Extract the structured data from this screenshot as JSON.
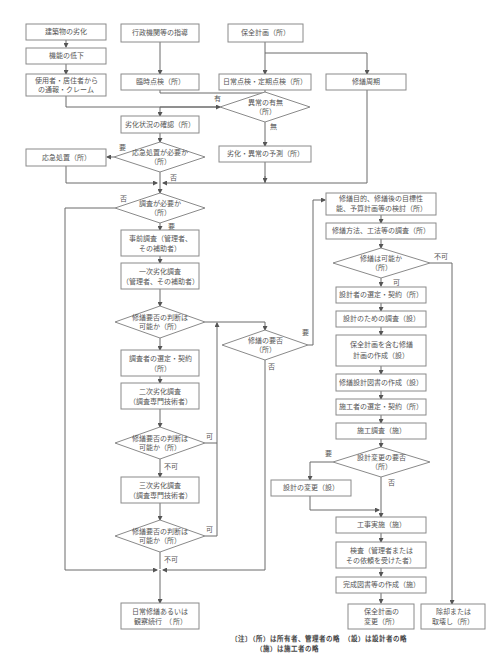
{
  "diagram": {
    "top": {
      "deterioration": "建築物の劣化",
      "function_decline": "機能の低下",
      "report_l1": "使用者・居住者から",
      "report_l2": "の通報・クレーム",
      "admin_guidance": "行政機関等の指導",
      "adhoc_inspection": "臨時点検（所）",
      "maintenance_plan": "保全計画（所）",
      "routine_inspection": "日常点検・定期点検（所）",
      "repair_cycle": "修繕周期"
    },
    "left": {
      "abnormality_q_l1": "異常の有無",
      "abnormality_q_l2": "（所）",
      "label_yes": "有",
      "label_no": "無",
      "confirm_condition": "劣化状況の確認（所）",
      "prediction": "劣化・異常の予測（所）",
      "emergency_q_l1": "応急処置が必要か",
      "emergency_q_l2": "（所）",
      "label_emergency_need": "要",
      "label_emergency_not": "否",
      "emergency_action": "応急処置（所）",
      "survey_q_l1": "調査が必要か",
      "survey_q_l2": "（所）",
      "label_survey_no": "否",
      "label_survey_need": "要",
      "pre_survey_l1": "事前調査（管理者、",
      "pre_survey_l2": "その補助者）",
      "primary_survey_l1": "一次劣化調査",
      "primary_survey_l2": "（管理者、その補助者）",
      "judge1_l1": "修繕要否の判断は",
      "judge1_l2": "可能か（所）",
      "investigator_select_l1": "調査者の選定・契約",
      "investigator_select_l2": "（所）",
      "secondary_survey_l1": "二次劣化調査",
      "secondary_survey_l2": "（調査専門技術者）",
      "judge2_l1": "修繕要否の判断は",
      "judge2_l2": "可能か（所）",
      "label_judge2_yes": "可",
      "label_judge2_no": "不可",
      "tertiary_survey_l1": "三次劣化調査",
      "tertiary_survey_l2": "（調査専門技術者）",
      "judge3_l1": "修繕要否の判断は",
      "judge3_l2": "可能か（所）",
      "label_judge3_yes": "可",
      "label_judge3_no": "不可",
      "repair_need_q_l1": "修繕の要否",
      "repair_need_q_l2": "（所）",
      "label_repair_need": "要",
      "label_repair_not": "否",
      "daily_repair_l1": "日常修繕あるいは",
      "daily_repair_l2": "観察続行　（所）"
    },
    "right": {
      "repair_purpose_l1": "修繕目的、修繕後の目標性",
      "repair_purpose_l2": "能、予算計画等の検討（所）",
      "method_survey": "修繕方法、工法等の調査（所）",
      "feasible_q_l1": "修繕は可能か",
      "feasible_q_l2": "（所）",
      "label_feasible_yes": "可",
      "label_feasible_no": "不可",
      "designer_select": "設計者の選定・契約（所）",
      "design_survey": "設計のための調査（設）",
      "plan_create_l1": "保全計画を含む修繕",
      "plan_create_l2": "計画の作成（設）",
      "design_docs": "修繕設計図書の作成（設）",
      "contractor_select": "施工者の選定・契約（所）",
      "construction_survey": "施工調査（施）",
      "design_change_q_l1": "設計変更の要否",
      "design_change_q_l2": "（所）",
      "label_change_need": "要",
      "label_change_not": "否",
      "design_change": "設計の変更（設）",
      "construction": "工事実施（施）",
      "inspection_l1": "検査（管理者または",
      "inspection_l2": "その依頼を受けた者）",
      "completion_docs": "完成図書等の作成（施）",
      "plan_update_l1": "保全計画の",
      "plan_update_l2": "変更（所）",
      "demolition_l1": "除却または",
      "demolition_l2": "取壊し（所）"
    },
    "notes": {
      "line1": "〔注〕（所）は所有者、管理者の略　（設）は設計者の略",
      "line2": "（施）は施工者の略"
    }
  }
}
